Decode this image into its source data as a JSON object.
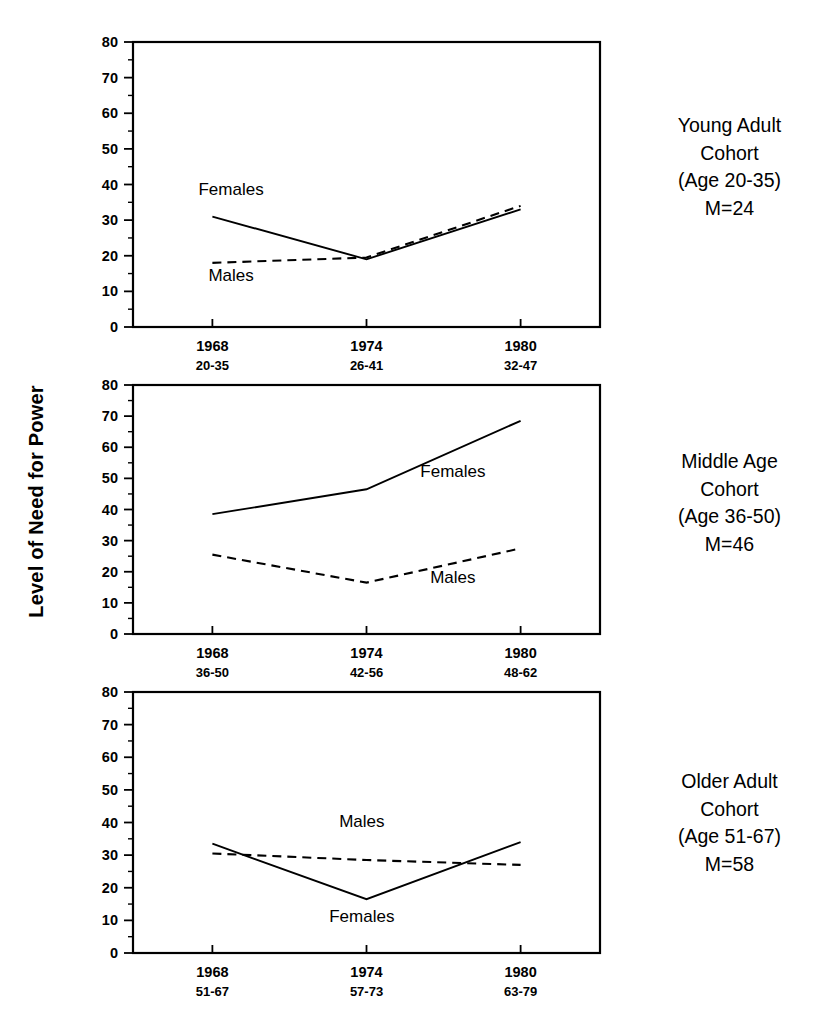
{
  "figure": {
    "y_axis_title": "Level of Need for Power"
  },
  "chart_data": {
    "type": "line",
    "xlabel": "",
    "ylabel": "Level of Need for Power",
    "ylim": [
      0,
      80
    ],
    "ytick_values": [
      0,
      10,
      20,
      30,
      40,
      50,
      60,
      70,
      80
    ],
    "ytick_labels": [
      "0",
      "10",
      "20",
      "30",
      "40",
      "50",
      "60",
      "70",
      "80"
    ],
    "yminor_step": 5,
    "grid": false,
    "legend": "inline-annotations",
    "x": [
      "1968",
      "1974",
      "1980"
    ],
    "panels": [
      {
        "id": "young-adult",
        "caption_lines": [
          "Young Adult",
          "Cohort",
          "(Age 20-35)",
          "M=24"
        ],
        "cohort_name": "Young Adult Cohort",
        "age_range": "Age 20-35",
        "mean_age": "M=24",
        "xtick_years": [
          "1968",
          "1974",
          "1980"
        ],
        "xtick_ages": [
          "20-35",
          "26-41",
          "32-47"
        ],
        "series": [
          {
            "name": "Females",
            "style": "solid",
            "values": [
              31.0,
              19.0,
              33.0
            ],
            "label_x_frac": 0.21,
            "label_y_value": 37.0
          },
          {
            "name": "Males",
            "style": "dashed",
            "values": [
              18.0,
              19.5,
              34.0
            ],
            "label_x_frac": 0.21,
            "label_y_value": 13.0
          }
        ]
      },
      {
        "id": "middle-age",
        "caption_lines": [
          "Middle Age",
          "Cohort",
          "(Age 36-50)",
          "M=46"
        ],
        "cohort_name": "Middle Age Cohort",
        "age_range": "Age 36-50",
        "mean_age": "M=46",
        "xtick_years": [
          "1968",
          "1974",
          "1980"
        ],
        "xtick_ages": [
          "36-50",
          "42-56",
          "48-62"
        ],
        "series": [
          {
            "name": "Females",
            "style": "solid",
            "values": [
              38.5,
              46.5,
              68.5
            ],
            "label_x_frac": 0.685,
            "label_y_value": 50.5
          },
          {
            "name": "Males",
            "style": "dashed",
            "values": [
              25.5,
              16.5,
              27.5
            ],
            "label_x_frac": 0.685,
            "label_y_value": 16.5
          }
        ]
      },
      {
        "id": "older-adult",
        "caption_lines": [
          "Older Adult",
          "Cohort",
          "(Age 51-67)",
          "M=58"
        ],
        "cohort_name": "Older Adult Cohort",
        "age_range": "Age 51-67",
        "mean_age": "M=58",
        "xtick_years": [
          "1968",
          "1974",
          "1980"
        ],
        "xtick_ages": [
          "51-67",
          "57-73",
          "63-79"
        ],
        "series": [
          {
            "name": "Females",
            "style": "solid",
            "values": [
              33.5,
              16.5,
              34.0
            ],
            "label_x_frac": 0.49,
            "label_y_value": 9.5
          },
          {
            "name": "Males",
            "style": "dashed",
            "values": [
              30.5,
              28.5,
              27.0
            ],
            "label_x_frac": 0.49,
            "label_y_value": 38.5
          }
        ]
      }
    ]
  }
}
